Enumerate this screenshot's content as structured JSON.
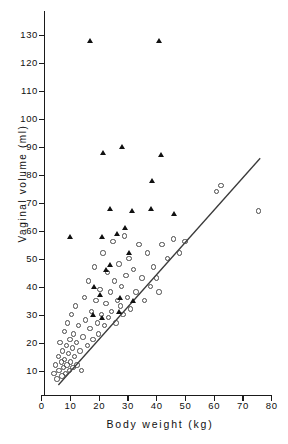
{
  "figure": {
    "background": "#ffffff",
    "foreground": "#111111"
  },
  "axes": {
    "y": {
      "label": "Vaginal volume (ml)",
      "ticks": [
        10,
        20,
        30,
        40,
        50,
        60,
        70,
        80,
        90,
        100,
        110,
        120,
        130
      ],
      "tick_labels": [
        "10",
        "20",
        "30",
        "40",
        "50",
        "60",
        "70",
        "80",
        "90",
        "100",
        "110",
        "120",
        "130"
      ],
      "min": 0,
      "max": 130
    },
    "x": {
      "label": "Body weight (kg)",
      "ticks": [
        0,
        10,
        20,
        30,
        40,
        50,
        60,
        70,
        80
      ],
      "tick_labels": [
        "0",
        "10",
        "20",
        "30",
        "40",
        "50",
        "60",
        "70",
        "80"
      ],
      "min": 0,
      "max": 80
    }
  },
  "chart_data": {
    "type": "scatter",
    "title": "",
    "xlabel": "Body weight (kg)",
    "ylabel": "Vaginal volume (ml)",
    "xlim": [
      0,
      80
    ],
    "ylim": [
      0,
      130
    ],
    "grid": false,
    "legend": "none",
    "series": [
      {
        "name": "open-circles",
        "marker": "open-circle",
        "color": "#4a4a4a",
        "points": [
          [
            4.5,
            9
          ],
          [
            5.0,
            12
          ],
          [
            5.5,
            7
          ],
          [
            6.0,
            15
          ],
          [
            6.2,
            10
          ],
          [
            6.5,
            20
          ],
          [
            7.0,
            13
          ],
          [
            7.2,
            8
          ],
          [
            7.5,
            17
          ],
          [
            7.8,
            11
          ],
          [
            8.0,
            24
          ],
          [
            8.2,
            14
          ],
          [
            8.5,
            9
          ],
          [
            8.8,
            19
          ],
          [
            9.0,
            12
          ],
          [
            9.2,
            27
          ],
          [
            9.5,
            16
          ],
          [
            9.8,
            10
          ],
          [
            10.0,
            21
          ],
          [
            10.2,
            13
          ],
          [
            10.5,
            30
          ],
          [
            10.8,
            18
          ],
          [
            11.0,
            11
          ],
          [
            11.2,
            23
          ],
          [
            11.5,
            15
          ],
          [
            12.0,
            33
          ],
          [
            12.2,
            20
          ],
          [
            12.5,
            12
          ],
          [
            13.0,
            26
          ],
          [
            13.5,
            17
          ],
          [
            14.0,
            10
          ],
          [
            14.5,
            22
          ],
          [
            15.0,
            36
          ],
          [
            15.5,
            28
          ],
          [
            16.0,
            19
          ],
          [
            16.5,
            42
          ],
          [
            17.0,
            25
          ],
          [
            17.5,
            31
          ],
          [
            18.0,
            21
          ],
          [
            18.5,
            47
          ],
          [
            19.0,
            35
          ],
          [
            19.5,
            27
          ],
          [
            20.0,
            23
          ],
          [
            20.5,
            39
          ],
          [
            21.0,
            30
          ],
          [
            21.5,
            52
          ],
          [
            22.0,
            26
          ],
          [
            22.5,
            34
          ],
          [
            23.0,
            45
          ],
          [
            23.5,
            29
          ],
          [
            24.0,
            38
          ],
          [
            24.5,
            31
          ],
          [
            25.0,
            56
          ],
          [
            25.5,
            42
          ],
          [
            26.0,
            27
          ],
          [
            26.5,
            35
          ],
          [
            27.0,
            48
          ],
          [
            27.5,
            33
          ],
          [
            28.0,
            40
          ],
          [
            28.5,
            30
          ],
          [
            29.0,
            58
          ],
          [
            29.5,
            44
          ],
          [
            30.0,
            36
          ],
          [
            30.5,
            50
          ],
          [
            31.0,
            32
          ],
          [
            32.0,
            46
          ],
          [
            33.0,
            38
          ],
          [
            34.0,
            55
          ],
          [
            35.0,
            43
          ],
          [
            36.0,
            35
          ],
          [
            37.0,
            52
          ],
          [
            38.0,
            40
          ],
          [
            39.0,
            47
          ],
          [
            40.0,
            43
          ],
          [
            41.0,
            38
          ],
          [
            42.0,
            55
          ],
          [
            44.0,
            50
          ],
          [
            46.0,
            57
          ],
          [
            48.0,
            52
          ],
          [
            50.0,
            56
          ],
          [
            61.0,
            74
          ],
          [
            62.5,
            76
          ],
          [
            75.5,
            67
          ]
        ]
      },
      {
        "name": "filled-triangles",
        "marker": "filled-triangle",
        "color": "#111111",
        "points": [
          [
            17.0,
            128
          ],
          [
            41.0,
            128
          ],
          [
            21.5,
            88
          ],
          [
            28.0,
            90
          ],
          [
            41.5,
            87
          ],
          [
            38.5,
            78
          ],
          [
            24.0,
            68
          ],
          [
            31.5,
            67
          ],
          [
            38.0,
            68
          ],
          [
            46.0,
            66
          ],
          [
            29.0,
            61
          ],
          [
            10.0,
            58
          ],
          [
            21.0,
            58
          ],
          [
            26.5,
            59
          ],
          [
            24.0,
            48
          ],
          [
            22.5,
            46
          ],
          [
            30.5,
            52
          ],
          [
            18.5,
            40
          ],
          [
            20.5,
            37
          ],
          [
            27.5,
            36
          ],
          [
            32.0,
            35
          ],
          [
            18.0,
            30
          ],
          [
            21.0,
            29
          ],
          [
            27.0,
            31
          ]
        ]
      }
    ],
    "regression_line": {
      "name": "fitted-line",
      "color": "#3a3a3a",
      "x_start": 5.8,
      "y_start": 5.0,
      "x_end": 76.0,
      "y_end": 86.0
    }
  }
}
